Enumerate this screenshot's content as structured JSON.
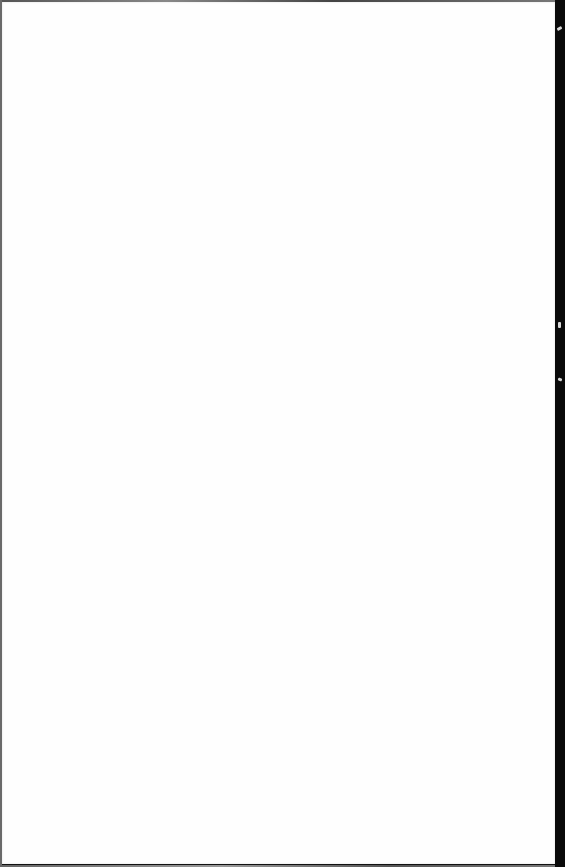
{
  "document": {
    "type": "blank-page",
    "text": "",
    "colors": {
      "paper": "#fefefe",
      "background": "#0a0a0a",
      "edge": "#6a6a6a"
    }
  }
}
